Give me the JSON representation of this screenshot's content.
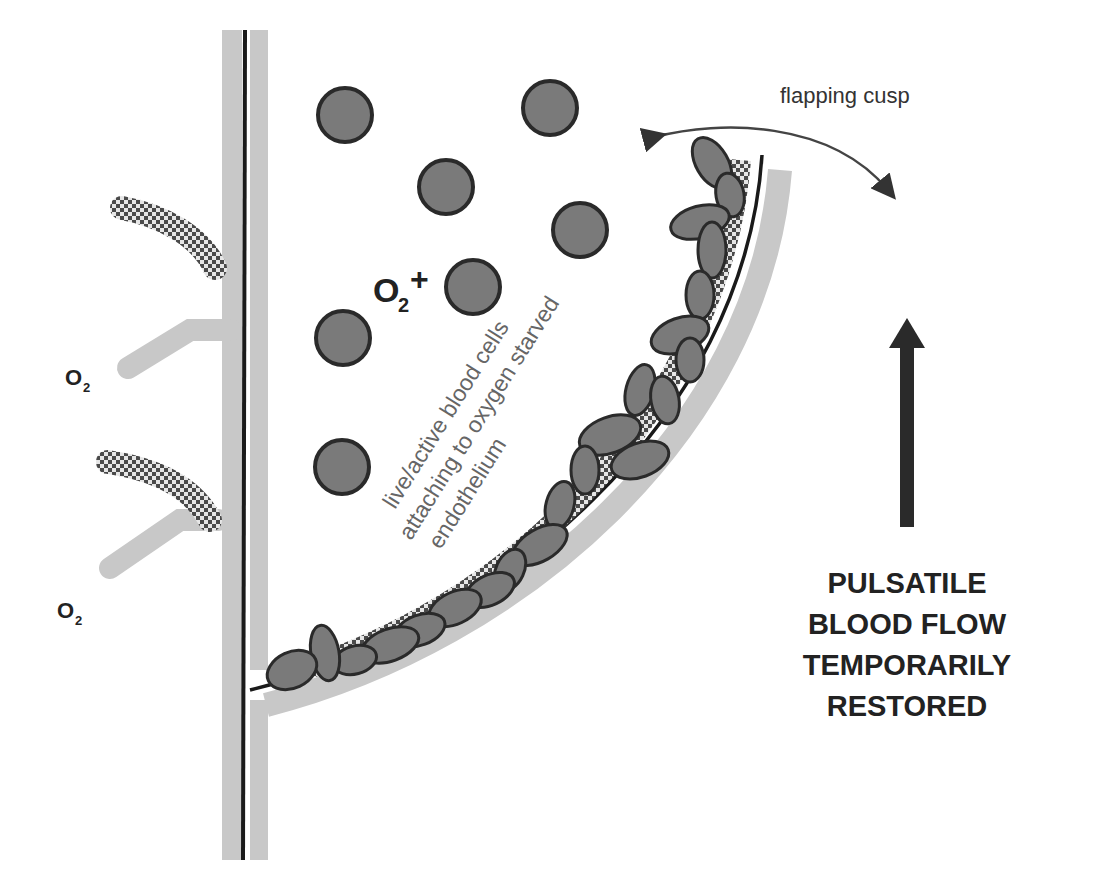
{
  "diagram": {
    "labels": {
      "flapping_cusp": "flapping cusp",
      "oxygen_plus": "O",
      "oxygen_plus_sub": "2",
      "oxygen_plus_sign": "+",
      "o2_upper": "O",
      "o2_upper_sub": "2",
      "o2_lower": "O",
      "o2_lower_sub": "2",
      "cells_line1": "live/active blood cells",
      "cells_line2": "attaching to oxygen starved",
      "cells_line3": "endothelium",
      "flow_line1": "PULSATILE",
      "flow_line2": "BLOOD FLOW",
      "flow_line3": "TEMPORARILY",
      "flow_line4": "RESTORED"
    },
    "colors": {
      "vessel_wall": "#c8c8c8",
      "cell_fill": "#7a7a7a",
      "cell_stroke": "#2a2a2a",
      "line": "#1a1a1a",
      "arrow": "#2a2a2a"
    }
  }
}
